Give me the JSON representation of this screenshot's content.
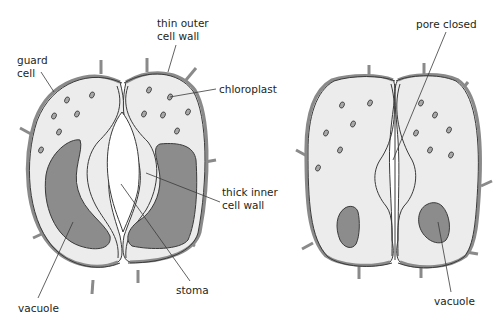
{
  "diagram": {
    "colors": {
      "background": "#ffffff",
      "cell_fill": "#ececec",
      "wall_gray": "#8a8a8a",
      "outline": "#3a3a3a",
      "vacuole": "#8c8c8c",
      "stoma_pore": "#ffffff",
      "leader_line": "#3a3a3a"
    },
    "open_stoma": {
      "labels": {
        "thin_outer_wall_line1": "thin outer",
        "thin_outer_wall_line2": "cell wall",
        "guard_cell_line1": "guard",
        "guard_cell_line2": "cell",
        "chloroplast": "chloroplast",
        "thick_inner_wall_line1": "thick inner",
        "thick_inner_wall_line2": "cell wall",
        "stoma": "stoma",
        "vacuole": "vacuole"
      }
    },
    "closed_stoma": {
      "labels": {
        "pore_closed": "pore closed",
        "vacuole": "vacuole"
      }
    }
  }
}
